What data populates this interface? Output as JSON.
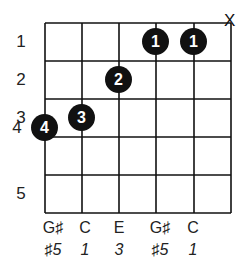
{
  "diagram": {
    "type": "guitar-chord-chart",
    "muted_string": "X",
    "fret_numbers": [
      "1",
      "2",
      "3",
      "4",
      "5"
    ],
    "fingers": [
      {
        "string": 1,
        "fret": 4,
        "finger": "4"
      },
      {
        "string": 2,
        "fret": 3,
        "finger": "3"
      },
      {
        "string": 3,
        "fret": 2,
        "finger": "2"
      },
      {
        "string": 4,
        "fret": 1,
        "finger": "1"
      },
      {
        "string": 5,
        "fret": 1,
        "finger": "1"
      }
    ],
    "notes": [
      "G♯",
      "C",
      "E",
      "G♯",
      "C"
    ],
    "degrees": [
      "♯5",
      "1",
      "3",
      "♯5",
      "1"
    ]
  }
}
